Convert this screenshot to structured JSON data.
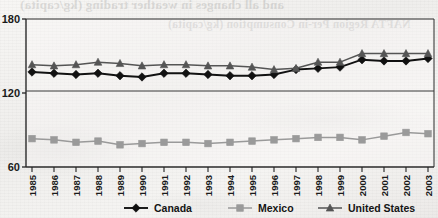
{
  "document": {
    "bleed_through_top": "and all changes in weather trading (kg/capita)",
    "bleed_through_title": "NAFTA Region Per-in Consumption (kg/capita)",
    "bleed_through_right": "NAFTA Region Per-in C"
  },
  "colors": {
    "canada": "#111111",
    "mexico": "#9a9a9a",
    "united_states": "#555555",
    "axis": "#222222",
    "gridline": "#333333",
    "paper": "#f4f3f1"
  },
  "chart_data": {
    "type": "line",
    "title": "NAFTA Region Per-in Consumption (kg/capita)",
    "xlabel": "",
    "ylabel": "",
    "ylim": [
      60,
      180
    ],
    "yticks": [
      60,
      120,
      180
    ],
    "grid": false,
    "legend_position": "bottom",
    "categories": [
      "1985",
      "1986",
      "1987",
      "1988",
      "1989",
      "1990",
      "1991",
      "1992",
      "1993",
      "1994",
      "1995",
      "1996",
      "1997",
      "1998",
      "1999",
      "2000",
      "2001",
      "2002",
      "2003"
    ],
    "series": [
      {
        "name": "Canada",
        "marker": "diamond",
        "color": "#111111",
        "values": [
          137,
          136,
          135,
          136,
          134,
          133,
          136,
          136,
          135,
          134,
          134,
          135,
          139,
          140,
          141,
          147,
          146,
          146,
          148
        ]
      },
      {
        "name": "Mexico",
        "marker": "square",
        "color": "#9a9a9a",
        "values": [
          83,
          82,
          80,
          81,
          78,
          79,
          80,
          80,
          79,
          80,
          81,
          82,
          83,
          84,
          84,
          82,
          85,
          88,
          87
        ]
      },
      {
        "name": "United States",
        "marker": "triangle",
        "color": "#555555",
        "values": [
          143,
          142,
          143,
          145,
          144,
          142,
          143,
          143,
          142,
          142,
          141,
          139,
          140,
          145,
          145,
          152,
          152,
          152,
          152
        ]
      }
    ]
  },
  "axis": {
    "y_tick_labels": [
      "180",
      "120",
      "60"
    ],
    "x_tick_labels": [
      "1985",
      "1986",
      "1987",
      "1988",
      "1989",
      "1990",
      "1991",
      "1992",
      "1993",
      "1994",
      "1995",
      "1996",
      "1997",
      "1998",
      "1999",
      "2000",
      "2001",
      "2002",
      "2003"
    ]
  },
  "legend": {
    "items": [
      {
        "label": "Canada",
        "marker": "diamond",
        "color": "#111111"
      },
      {
        "label": "Mexico",
        "marker": "square",
        "color": "#9a9a9a"
      },
      {
        "label": "United States",
        "marker": "triangle",
        "color": "#555555"
      }
    ]
  }
}
